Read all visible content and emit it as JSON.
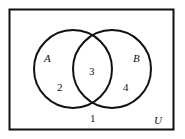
{
  "diagram": {
    "type": "venn",
    "universe_label": "U",
    "sets": [
      {
        "name": "A",
        "label": "A"
      },
      {
        "name": "B",
        "label": "B"
      }
    ],
    "regions": {
      "outside": "1",
      "a_only": "2",
      "a_and_b": "3",
      "b_only": "4"
    },
    "colors": {
      "stroke": "#111111",
      "background": "#ffffff"
    }
  }
}
